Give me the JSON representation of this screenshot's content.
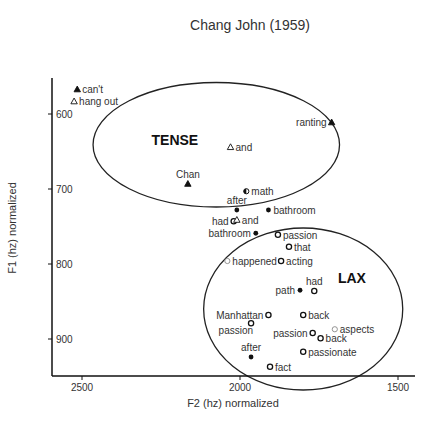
{
  "chart_data": {
    "type": "scatter",
    "title": "Chang John (1959)",
    "xlabel": "F2 (hz) normalized",
    "ylabel": "F1 (hz) normalized",
    "x_reversed": true,
    "y_reversed": true,
    "xlim": [
      2610,
      1450
    ],
    "ylim": [
      552,
      950
    ],
    "x_ticks": [
      2500,
      2000,
      1500
    ],
    "y_ticks": [
      600,
      700,
      800,
      900
    ],
    "grid": false,
    "legend": null,
    "regions": [
      {
        "label": "TENSE",
        "cx": 2075,
        "cy": 641,
        "rx_hz": 390,
        "ry_hz": 83,
        "label_x": 2280,
        "label_y": 634
      },
      {
        "label": "LAX",
        "cx": 1800,
        "cy": 860,
        "rx_hz": 315,
        "ry_hz": 108,
        "label_x": 1690,
        "label_y": 818
      }
    ],
    "points": [
      {
        "label": "can't",
        "F2": 2515,
        "F1": 567,
        "marker": "triangle-filled",
        "label_side": "right"
      },
      {
        "label": "hang out",
        "F2": 2525,
        "F1": 583,
        "marker": "triangle-open",
        "label_side": "right"
      },
      {
        "label": "ranting",
        "F2": 1710,
        "F1": 611,
        "marker": "triangle-filled",
        "label_side": "left"
      },
      {
        "label": "and",
        "F2": 2030,
        "F1": 644,
        "marker": "triangle-open",
        "label_side": "right"
      },
      {
        "label": "Chan",
        "F2": 2165,
        "F1": 693,
        "marker": "triangle-filled",
        "label_side": "above"
      },
      {
        "label": "math",
        "F2": 1980,
        "F1": 703,
        "marker": "circle-half",
        "label_side": "right"
      },
      {
        "label": "after",
        "F2": 2010,
        "F1": 728,
        "marker": "circle-filled",
        "label_side": "above"
      },
      {
        "label": "bathroom",
        "F2": 1910,
        "F1": 728,
        "marker": "circle-filled",
        "label_side": "right"
      },
      {
        "label": "had",
        "F2": 2020,
        "F1": 743,
        "marker": "circle-open",
        "label_side": "left"
      },
      {
        "label": "and",
        "F2": 2010,
        "F1": 741,
        "marker": "triangle-open",
        "label_side": "right"
      },
      {
        "label": "bathroom",
        "F2": 1950,
        "F1": 759,
        "marker": "circle-filled",
        "label_side": "left"
      },
      {
        "label": "passion",
        "F2": 1880,
        "F1": 761,
        "marker": "circle-open",
        "label_side": "right"
      },
      {
        "label": "that",
        "F2": 1845,
        "F1": 777,
        "marker": "circle-open",
        "label_side": "right"
      },
      {
        "label": "happened",
        "F2": 2040,
        "F1": 796,
        "marker": "circle-open-light",
        "label_side": "right"
      },
      {
        "label": "acting",
        "F2": 1870,
        "F1": 796,
        "marker": "circle-open",
        "label_side": "right"
      },
      {
        "label": "path",
        "F2": 1810,
        "F1": 835,
        "marker": "circle-filled",
        "label_side": "left"
      },
      {
        "label": "had",
        "F2": 1765,
        "F1": 836,
        "marker": "circle-open",
        "label_side": "above"
      },
      {
        "label": "Manhattan",
        "F2": 1910,
        "F1": 868,
        "marker": "circle-open",
        "label_side": "left"
      },
      {
        "label": "passion",
        "F2": 1965,
        "F1": 879,
        "marker": "circle-open",
        "label_side": "below-left"
      },
      {
        "label": "back",
        "F2": 1800,
        "F1": 868,
        "marker": "circle-open",
        "label_side": "right"
      },
      {
        "label": "aspects",
        "F2": 1700,
        "F1": 887,
        "marker": "circle-open-light",
        "label_side": "right"
      },
      {
        "label": "passion",
        "F2": 1770,
        "F1": 892,
        "marker": "circle-open",
        "label_side": "left"
      },
      {
        "label": "back",
        "F2": 1745,
        "F1": 899,
        "marker": "circle-open",
        "label_side": "right"
      },
      {
        "label": "after",
        "F2": 1965,
        "F1": 924,
        "marker": "circle-filled",
        "label_side": "above"
      },
      {
        "label": "passionate",
        "F2": 1800,
        "F1": 917,
        "marker": "circle-open",
        "label_side": "right"
      },
      {
        "label": "fact",
        "F2": 1905,
        "F1": 937,
        "marker": "circle-open",
        "label_side": "right"
      }
    ]
  },
  "colors": {
    "axis": "#111111",
    "ellipse": "#222222",
    "marker": "#111111",
    "marker_light": "#888888",
    "text": "#333333"
  }
}
